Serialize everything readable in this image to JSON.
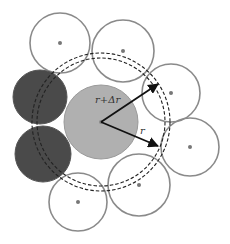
{
  "diagram": {
    "title": "",
    "colors": {
      "outline": "#8a8a8a",
      "center_dot": "#777777",
      "central_fill": "#b0b0b0",
      "central_stroke": "#9a9a9a",
      "dark_fill": "#4a4a4a",
      "dashed": "#222222",
      "arrow": "#111111"
    },
    "central_particle": {
      "cx": 101,
      "cy": 122,
      "r": 37
    },
    "dashed_shells": [
      {
        "cx": 101,
        "cy": 122,
        "r": 64
      },
      {
        "cx": 101,
        "cy": 122,
        "r": 69
      }
    ],
    "neighbor_particles": [
      {
        "id": "top-left",
        "cx": 60,
        "cy": 43,
        "r": 30
      },
      {
        "id": "top-middle",
        "cx": 123,
        "cy": 51,
        "r": 31
      },
      {
        "id": "right-upper",
        "cx": 171,
        "cy": 93,
        "r": 29
      },
      {
        "id": "right-lower",
        "cx": 190,
        "cy": 147,
        "r": 29
      },
      {
        "id": "bottom-middle",
        "cx": 139,
        "cy": 185,
        "r": 31
      },
      {
        "id": "bottom-left",
        "cx": 78,
        "cy": 202,
        "r": 29
      }
    ],
    "shaded_particles": [
      {
        "id": "dark-upper",
        "cx": 40,
        "cy": 97,
        "r": 27
      },
      {
        "id": "dark-lower",
        "cx": 43,
        "cy": 154,
        "r": 28
      }
    ],
    "arrows": [
      {
        "id": "arrow-r-plus-dr",
        "x1": 101,
        "y1": 122,
        "x2": 158,
        "y2": 84
      },
      {
        "id": "arrow-r",
        "x1": 101,
        "y1": 122,
        "x2": 158,
        "y2": 146
      }
    ],
    "labels": {
      "r_plus_dr": {
        "text": "r+Δr",
        "x": 95,
        "y": 103
      },
      "r": {
        "text": "r",
        "x": 140,
        "y": 134
      }
    }
  }
}
